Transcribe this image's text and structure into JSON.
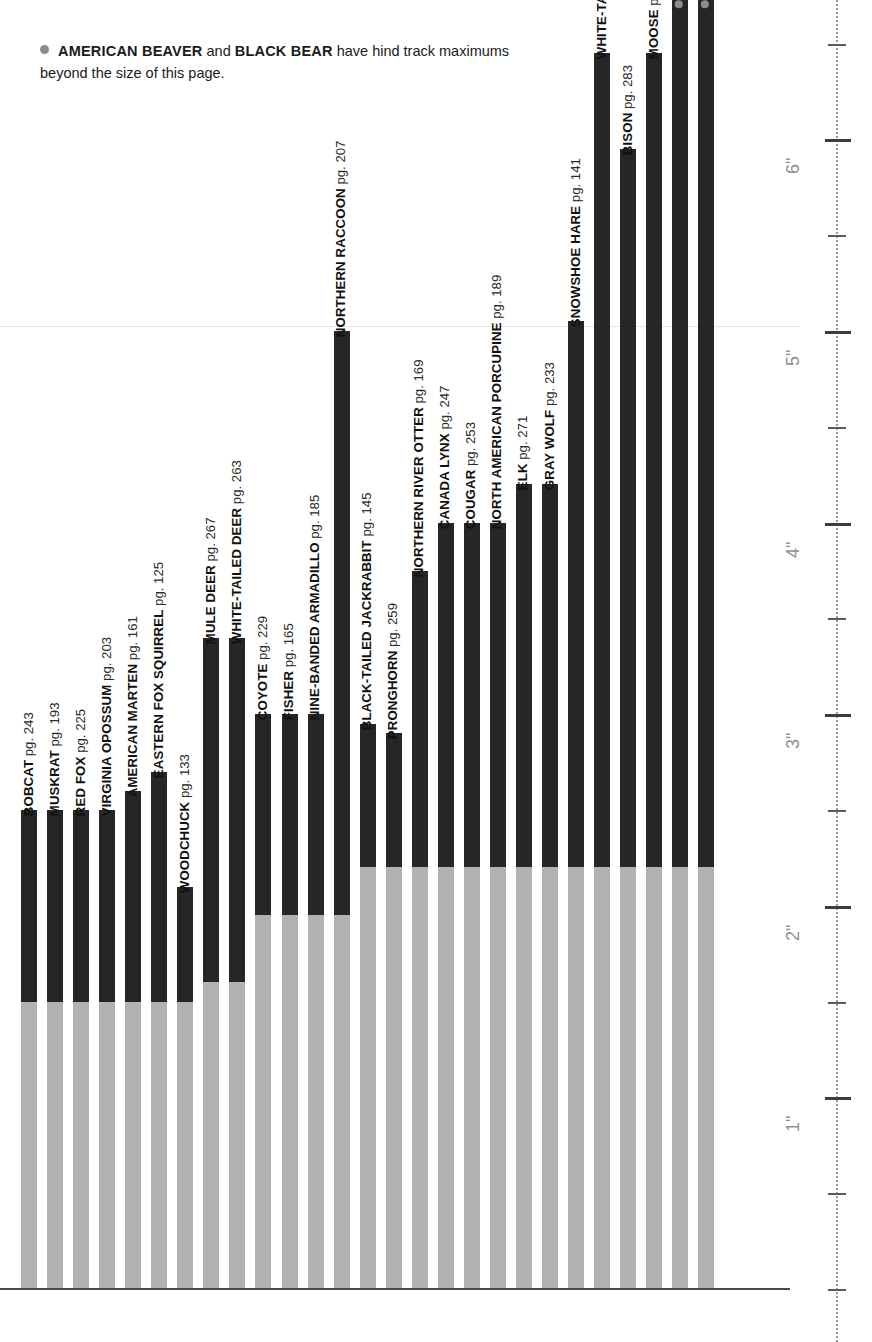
{
  "note": {
    "bullet_icon": "gray-dot",
    "part1_bold": "AMERICAN BEAVER",
    "mid": " and ",
    "part2_bold": "BLACK BEAR",
    "tail": " have hind track maximums beyond the size of this page."
  },
  "axis": {
    "unit": "inch",
    "tick_labels": [
      "1\"",
      "2\"",
      "3\"",
      "4\"",
      "5\"",
      "6\""
    ],
    "range_inches": [
      0,
      6.75
    ],
    "minor_step_inches": 0.125,
    "major_step_inches": 0.5
  },
  "chart_data": {
    "type": "bar",
    "title": "",
    "subtitle": "",
    "xlabel": "",
    "ylabel": "inches",
    "ylim": [
      0,
      6.75
    ],
    "grid": "dotted vertical ruler on right",
    "legend": "none",
    "orientation": "vertical",
    "note": "Each bar spans a minimum (light gray segment) to a maximum (dark segment) hind-track length in inches.",
    "series": [
      {
        "name": "minimum",
        "color": "#b2b2b2"
      },
      {
        "name": "maximum",
        "color": "#262626"
      }
    ],
    "categories": [
      "BOBCAT",
      "MUSKRAT",
      "RED FOX",
      "VIRGINIA OPOSSUM",
      "AMERICAN MARTEN",
      "EASTERN FOX SQUIRREL",
      "WOODCHUCK",
      "MULE DEER",
      "WHITE-TAILED DEER",
      "COYOTE",
      "FISHER",
      "NINE-BANDED ARMADILLO",
      "NORTHERN RACCOON",
      "BLACK-TAILED JACKRABBIT",
      "PRONGHORN",
      "NORTHERN RIVER OTTER",
      "CANADA LYNX",
      "COUGAR",
      "NORTH AMERICAN PORCUPINE",
      "ELK",
      "GRAY WOLF",
      "SNOWSHOE HARE",
      "WHITE-TAILED JACKRABBIT",
      "BISON",
      "MOOSE",
      "AMERICAN BEAVER",
      "BLACK BEAR"
    ],
    "pages": [
      243,
      193,
      225,
      203,
      161,
      125,
      133,
      267,
      263,
      229,
      165,
      185,
      207,
      145,
      259,
      169,
      247,
      253,
      189,
      271,
      233,
      141,
      149,
      283,
      277,
      197,
      211
    ],
    "min_values": [
      1.5,
      1.5,
      1.5,
      1.5,
      1.5,
      1.5,
      1.5,
      1.6,
      1.6,
      1.95,
      1.95,
      1.95,
      1.95,
      2.2,
      2.2,
      2.2,
      2.2,
      2.2,
      2.2,
      2.2,
      2.2,
      2.2,
      2.2,
      2.2,
      2.2,
      2.2,
      2.2
    ],
    "max_values": [
      2.5,
      2.5,
      2.5,
      2.5,
      2.6,
      2.7,
      2.1,
      3.4,
      3.4,
      3.0,
      3.0,
      3.0,
      5.0,
      2.95,
      2.9,
      3.75,
      4.0,
      4.0,
      4.0,
      4.2,
      4.2,
      5.05,
      6.45,
      5.95,
      6.45,
      7.2,
      7.2
    ],
    "offscale_flags": [
      false,
      false,
      false,
      false,
      false,
      false,
      false,
      false,
      false,
      false,
      false,
      false,
      false,
      false,
      false,
      false,
      false,
      false,
      false,
      false,
      false,
      false,
      false,
      false,
      false,
      true,
      true
    ]
  },
  "bars": [
    {
      "name": "BOBCAT",
      "pg": "pg. 243",
      "offscale": false
    },
    {
      "name": "MUSKRAT",
      "pg": "pg. 193",
      "offscale": false
    },
    {
      "name": "RED FOX",
      "pg": "pg. 225",
      "offscale": false
    },
    {
      "name": "VIRGINIA OPOSSUM",
      "pg": "pg. 203",
      "offscale": false
    },
    {
      "name": "AMERICAN MARTEN",
      "pg": "pg. 161",
      "offscale": false
    },
    {
      "name": "EASTERN FOX SQUIRREL",
      "pg": "pg. 125",
      "offscale": false
    },
    {
      "name": "WOODCHUCK",
      "pg": "pg. 133",
      "offscale": false
    },
    {
      "name": "MULE DEER",
      "pg": "pg. 267",
      "offscale": false
    },
    {
      "name": "WHITE-TAILED DEER",
      "pg": "pg. 263",
      "offscale": false
    },
    {
      "name": "COYOTE",
      "pg": "pg. 229",
      "offscale": false
    },
    {
      "name": "FISHER",
      "pg": "pg. 165",
      "offscale": false
    },
    {
      "name": "NINE-BANDED ARMADILLO",
      "pg": "pg. 185",
      "offscale": false
    },
    {
      "name": "NORTHERN RACCOON",
      "pg": "pg. 207",
      "offscale": false
    },
    {
      "name": "BLACK-TAILED JACKRABBIT",
      "pg": "pg. 145",
      "offscale": false
    },
    {
      "name": "PRONGHORN",
      "pg": "pg. 259",
      "offscale": false
    },
    {
      "name": "NORTHERN RIVER OTTER",
      "pg": "pg. 169",
      "offscale": false
    },
    {
      "name": "CANADA LYNX",
      "pg": "pg. 247",
      "offscale": false
    },
    {
      "name": "COUGAR",
      "pg": "pg. 253",
      "offscale": false
    },
    {
      "name": "NORTH AMERICAN PORCUPINE",
      "pg": "pg. 189",
      "offscale": false
    },
    {
      "name": "ELK",
      "pg": "pg. 271",
      "offscale": false
    },
    {
      "name": "GRAY WOLF",
      "pg": "pg. 233",
      "offscale": false
    },
    {
      "name": "SNOWSHOE HARE",
      "pg": "pg. 141",
      "offscale": false
    },
    {
      "name": "WHITE-TAILED JACKRABBIT",
      "pg": "pg. 149",
      "offscale": false
    },
    {
      "name": "BISON",
      "pg": "pg. 283",
      "offscale": false
    },
    {
      "name": "MOOSE",
      "pg": "pg. 277",
      "offscale": false
    },
    {
      "name": "AMERICAN BEAVER",
      "pg": "pg. 197",
      "offscale": true
    },
    {
      "name": "BLACK BEAR",
      "pg": "pg. 211",
      "offscale": true
    }
  ],
  "colors": {
    "bar_max": "#262626",
    "bar_min": "#b2b2b2",
    "bullet": "#8c8c8c",
    "axis_label": "#8f8f8f",
    "baseline": "#4b4b4b",
    "background": "#ffffff"
  }
}
